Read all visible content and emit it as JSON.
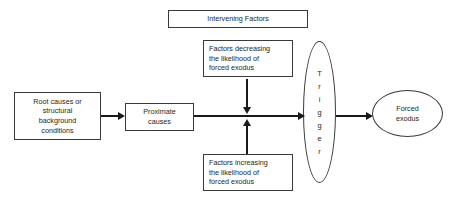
{
  "diagram": {
    "title_box": {
      "label": "Intervening Factors"
    },
    "nodes": {
      "root_causes": {
        "label": "Root causes or\nstructural\nbackground\nconditions",
        "shape": "rectangle"
      },
      "proximate_causes": {
        "label": "Proximate\ncauses",
        "shape": "rectangle"
      },
      "factors_decreasing": {
        "label": "Factors decreasing\nthe likelihood of\nforced exodus",
        "shape": "rectangle"
      },
      "factors_increasing": {
        "label": "Factors increasing\nthe likelihood of\nforced exodus",
        "shape": "rectangle"
      },
      "trigger": {
        "label": "Trigger",
        "letters": [
          "T",
          "r",
          "i",
          "g",
          "g",
          "e",
          "r"
        ],
        "shape": "ellipse",
        "orientation": "vertical"
      },
      "forced_exodus": {
        "label": "Forced\nexodus",
        "shape": "ellipse"
      }
    },
    "edges": [
      {
        "id": "root-to-proximate",
        "from": "root_causes",
        "to": "proximate_causes",
        "direction": "right",
        "label": ""
      },
      {
        "id": "proximate-to-trigger",
        "from": "proximate_causes",
        "to": "trigger",
        "direction": "right",
        "label": ""
      },
      {
        "id": "decreasing-to-flow",
        "from": "factors_decreasing",
        "to": "proximate-to-trigger",
        "direction": "down",
        "label": ""
      },
      {
        "id": "increasing-to-flow",
        "from": "factors_increasing",
        "to": "proximate-to-trigger",
        "direction": "up",
        "label": ""
      },
      {
        "id": "trigger-to-exodus",
        "from": "trigger",
        "to": "forced_exodus",
        "direction": "right",
        "label": ""
      }
    ],
    "colors": {
      "background": "#ffffff",
      "stroke": "#3a3a3a",
      "arrow": "#1a1a1a",
      "text": "#231f20"
    }
  }
}
